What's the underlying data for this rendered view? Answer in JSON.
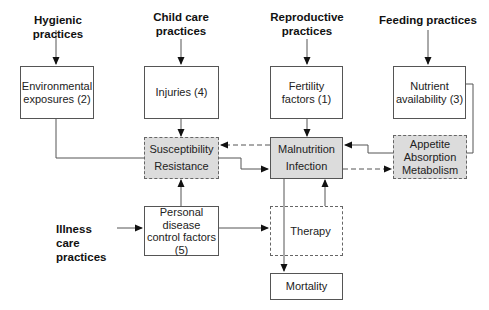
{
  "diagram": {
    "top_labels": [
      {
        "id": "hygienic",
        "text": "Hygienic practices"
      },
      {
        "id": "child_care",
        "line1": "Child care",
        "line2": "practices"
      },
      {
        "id": "reproductive",
        "line1": "Reproductive",
        "line2": "practices"
      },
      {
        "id": "feeding",
        "text": "Feeding practices"
      }
    ],
    "left_label": {
      "line1": "Illness care",
      "line2": "practices"
    },
    "boxes": {
      "environmental": {
        "line1": "Environmental",
        "line2": "exposures (2)"
      },
      "injuries": {
        "text": "Injuries (4)"
      },
      "fertility": {
        "line1": "Fertility",
        "line2": "factors (1)"
      },
      "nutrient": {
        "line1": "Nutrient",
        "line2": "availability (3)"
      },
      "susceptibility": {
        "line1": "Susceptibility",
        "line2": "Resistance"
      },
      "malnutrition": {
        "line1": "Malnutrition",
        "line2": "Infection"
      },
      "appetite": {
        "line1": "Appetite",
        "line2": "Absorption",
        "line3": "Metabolism"
      },
      "personal": {
        "line1": "Personal",
        "line2": "disease",
        "line3": "control factors",
        "line4": "(5)"
      },
      "therapy": {
        "text": "Therapy"
      },
      "mortality": {
        "text": "Mortality"
      }
    },
    "colors": {
      "shaded_fill": "#dcdcdc",
      "line": "#555555"
    }
  }
}
